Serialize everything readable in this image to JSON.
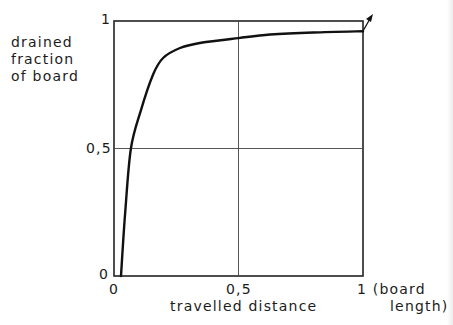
{
  "chart_data": {
    "type": "line",
    "title": "",
    "xlabel": "travelled distance",
    "xlabel_unit": "(board length)",
    "ylabel": "drained fraction of board",
    "xlim": [
      0,
      1
    ],
    "ylim": [
      0,
      1
    ],
    "grid": true,
    "x_ticks": [
      "0",
      "0,5",
      "1"
    ],
    "y_ticks": [
      "0",
      "0,5",
      "1"
    ],
    "legend": null,
    "annotations": [
      "arrow at right end of curve pointing up-right"
    ],
    "series": [
      {
        "name": "drained fraction",
        "x": [
          0.028,
          0.045,
          0.068,
          0.108,
          0.157,
          0.197,
          0.265,
          0.35,
          0.5,
          0.627,
          0.8,
          1.0
        ],
        "y": [
          0.0,
          0.25,
          0.5,
          0.65,
          0.79,
          0.855,
          0.894,
          0.915,
          0.933,
          0.947,
          0.955,
          0.96
        ]
      }
    ]
  },
  "labels": {
    "y_line1": "drained",
    "y_line2": "fraction",
    "y_line3": "of board",
    "y_tick_top": "1",
    "y_tick_mid": "0,5",
    "y_tick_bottom": "0",
    "x_tick_left": "0",
    "x_tick_mid": "0,5",
    "x_tick_right": "1 (board",
    "x_unit_line2": "length)",
    "x_title": "travelled distance"
  }
}
